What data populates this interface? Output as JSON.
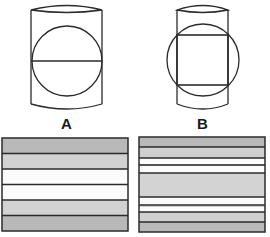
{
  "diagram": {
    "figure_a": {
      "label": "A",
      "description": "log cylinder with circle and single horizontal cut line"
    },
    "figure_b": {
      "label": "B",
      "description": "log cylinder with circle and inscribed square cut"
    },
    "board_a": {
      "bands": [
        "#b9b9b9",
        "#d2d2d2",
        "#fbfbfb",
        "#fbfbfb",
        "#d2d2d2",
        "#b9b9b9"
      ]
    },
    "board_b": {
      "bands": [
        "#b9b9b9",
        "#d0d0d0",
        "#fbfbfb",
        "#d0d0d0",
        "#fbfbfb",
        "#d3d3d3",
        "#fbfbfb",
        "#d0d0d0",
        "#fbfbfb",
        "#d0d0d0",
        "#b9b9b9"
      ]
    },
    "colors": {
      "stroke": "#2b2b2b",
      "background": "#ffffff"
    }
  }
}
